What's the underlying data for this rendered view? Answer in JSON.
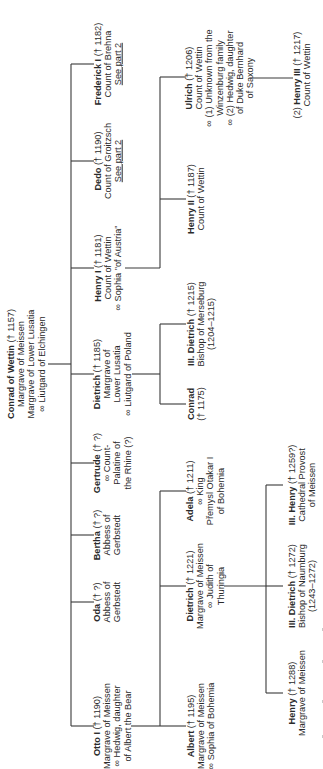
{
  "diagram": {
    "type": "family-tree",
    "orientation": "rotated-90-ccw",
    "root": {
      "name": "Conrad of Wettin",
      "dates": "(† 1157)",
      "lines": [
        "Margrave of Meissen",
        "Margrave of Lower Lusatia",
        "∞ Liutgard of Elchingen"
      ]
    },
    "children": [
      {
        "id": "otto",
        "name": "Otto I",
        "dates": "(† 1190)",
        "lines": [
          "Margrave of Meissen",
          "∞ Hedwig, daughter",
          "of Albert the Bear"
        ]
      },
      {
        "id": "oda",
        "name": "Oda",
        "dates": "(† ?)",
        "lines": [
          "Abbess of",
          "Gerbstedt"
        ]
      },
      {
        "id": "bertha",
        "name": "Bertha",
        "dates": "(† ?)",
        "lines": [
          "Abbess of",
          "Gerbstedt"
        ]
      },
      {
        "id": "gertrude",
        "name": "Gertrude",
        "dates": "(† ?)",
        "lines": [
          "∞ Count-",
          "Palatine of",
          "the Rhine (?)"
        ]
      },
      {
        "id": "dietrich",
        "name": "Dietrich",
        "dates": "(† 1185)",
        "lines": [
          "Margrave of",
          "Lower Lusatia",
          "∞ Liutgard of Poland"
        ]
      },
      {
        "id": "henry1",
        "name": "Henry I",
        "dates": "(† 1181)",
        "lines": [
          "Count of Wettin",
          "∞ Sophia \"of Austria\""
        ]
      },
      {
        "id": "dedo",
        "name": "Dedo",
        "dates": "(† 1190)",
        "lines": [
          "Count of Groitzsch"
        ],
        "link": "See part 2"
      },
      {
        "id": "frederick",
        "name": "Frederick I",
        "dates": "(† 1182)",
        "lines": [
          "Count of Brehna"
        ],
        "link": "See part 2"
      }
    ],
    "grandchildren": {
      "otto": [
        {
          "id": "albert",
          "name": "Albert",
          "dates": "(† 1195)",
          "lines": [
            "Margrave of Meissen",
            "∞ Sophia of Bohemia"
          ]
        },
        {
          "id": "dietrich_m",
          "name": "Dietrich",
          "dates": "(† 1221)",
          "lines": [
            "Margrave of Meissen",
            "∞ Judith of",
            "Thuringia"
          ]
        },
        {
          "id": "adela",
          "name": "Adela",
          "dates": "(† 1211)",
          "lines": [
            "∞ King",
            "Přemysl Otakar I",
            "of Bohemia"
          ]
        }
      ],
      "dietrich": [
        {
          "id": "conrad",
          "name": "Conrad",
          "dates": "(† 1175)",
          "lines": []
        },
        {
          "id": "dietrich_bishop",
          "name": "III. Dietrich",
          "dates": "(† 1215)",
          "lines": [
            "Bishop of Merseburg",
            "(1204–1215)"
          ]
        }
      ],
      "henry1": [
        {
          "id": "henry2",
          "name": "Henry II",
          "dates": "(† 1187)",
          "lines": [
            "Count of Wettin"
          ]
        },
        {
          "id": "ulrich",
          "name": "Ulrich",
          "dates": "(† 1206)",
          "lines": [
            "Count of Wettin",
            "∞ (1) Unknown from the",
            "Winzenburg family",
            "∞ (2) Hedwig, daughter",
            "of Duke Bernhard",
            "of Saxony"
          ]
        }
      ]
    },
    "great_grandchildren": {
      "dietrich_m": [
        {
          "id": "henry_m",
          "name": "Henry",
          "dates": "(† 1288)",
          "lines": [
            "Margrave of Meissen"
          ]
        },
        {
          "id": "dietrich_naumburg",
          "name": "III. Dietrich",
          "dates": "(† 1272)",
          "lines": [
            "Bishop of Naumburg",
            "(1243–1272)"
          ]
        },
        {
          "id": "henry_provost",
          "name": "III. Henry",
          "dates": "(† 1259?)",
          "lines": [
            "Cathedral Provost",
            "of Meissen"
          ]
        }
      ],
      "ulrich": [
        {
          "id": "henry3",
          "prefix": "(2)",
          "name": "Henry III",
          "dates": "(† 1217)",
          "lines": [
            "Count of Wettin"
          ]
        }
      ]
    },
    "colors": {
      "line": "#3a3a3a",
      "text": "#2a2a2a",
      "background": "#ffffff"
    }
  }
}
